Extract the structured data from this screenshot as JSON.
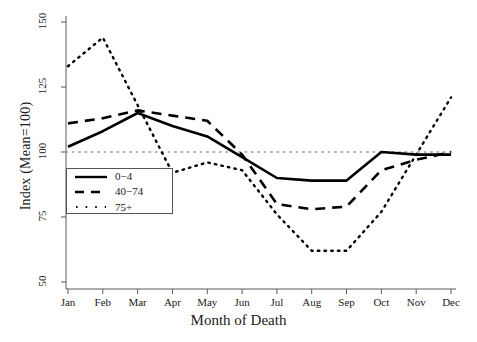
{
  "chart_data": {
    "type": "line",
    "title": "",
    "xlabel": "Month of Death",
    "ylabel": "Index (Mean=100)",
    "categories": [
      "Jan",
      "Feb",
      "Mar",
      "Apr",
      "May",
      "Jun",
      "Jul",
      "Aug",
      "Sep",
      "Oct",
      "Nov",
      "Dec"
    ],
    "xtick_labels": [
      "Jan",
      "Feb",
      "Mar",
      "Apr",
      "May",
      "Jun",
      "Jul",
      "Aug",
      "Sep",
      "Oct",
      "Nov",
      "Dec"
    ],
    "ytick_labels": [
      "50",
      "75",
      "100",
      "125",
      "150"
    ],
    "ytick_values": [
      50,
      75,
      100,
      125,
      150
    ],
    "ylim": [
      50,
      150
    ],
    "grid": false,
    "reference_line": {
      "value": 100,
      "style": "dotted",
      "color": "#999999"
    },
    "legend_position": "lower left",
    "series": [
      {
        "name": "0−4",
        "style": "solid",
        "color": "#000000",
        "values": [
          102,
          108,
          115,
          110,
          106,
          98,
          90,
          89,
          89,
          100,
          99,
          99
        ]
      },
      {
        "name": "40−74",
        "style": "dashed",
        "color": "#000000",
        "values": [
          111,
          113,
          116,
          114,
          112,
          99,
          80,
          78,
          79,
          93,
          97,
          100
        ]
      },
      {
        "name": "75+",
        "style": "dotted",
        "color": "#000000",
        "values": [
          133,
          144,
          118,
          92,
          96,
          93,
          76,
          62,
          62,
          77,
          99,
          121
        ]
      }
    ]
  },
  "legend": {
    "items": [
      {
        "label": "0−4",
        "style": "solid"
      },
      {
        "label": "40−74",
        "style": "dashed"
      },
      {
        "label": "75+",
        "style": "dotted"
      }
    ]
  },
  "axes": {
    "x_title": "Month of Death",
    "y_title": "Index (Mean=100)"
  }
}
